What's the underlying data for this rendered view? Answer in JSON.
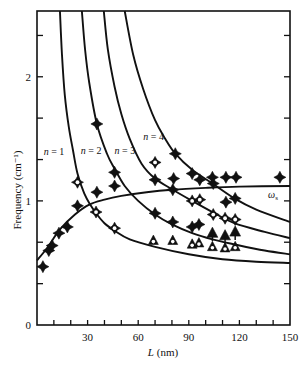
{
  "chart_data": {
    "type": "scatter",
    "title": "",
    "xlabel": "L (nm)",
    "xlabel_var": "L",
    "xlabel_unit": "(nm)",
    "ylabel": "Frequency (cm⁻¹)",
    "xlim": [
      0,
      150
    ],
    "ylim": [
      0,
      2.53
    ],
    "x_ticks": [
      0,
      10,
      20,
      30,
      40,
      50,
      60,
      70,
      80,
      90,
      100,
      110,
      120,
      130,
      140,
      150
    ],
    "x_tick_labels": [
      {
        "value": 30,
        "label": "30"
      },
      {
        "value": 60,
        "label": "60"
      },
      {
        "value": 90,
        "label": "90"
      },
      {
        "value": 120,
        "label": "120"
      },
      {
        "value": 150,
        "label": "150"
      }
    ],
    "y_ticks": [
      0,
      0.333,
      0.667,
      1,
      1.333,
      1.667,
      2,
      2.333
    ],
    "y_tick_labels": [
      {
        "value": 0,
        "label": "0"
      },
      {
        "value": 1,
        "label": "1"
      },
      {
        "value": 2,
        "label": "2"
      }
    ],
    "grid": false,
    "curves": [
      {
        "name": "n = 1",
        "label": "n = 1",
        "label_pos": [
          4,
          1.37
        ],
        "points": [
          [
            13.6,
            2.53
          ],
          [
            14.8,
            2.18
          ],
          [
            16.5,
            1.85
          ],
          [
            18.8,
            1.6
          ],
          [
            21.3,
            1.41
          ],
          [
            24,
            1.22
          ],
          [
            28,
            1.06
          ],
          [
            32,
            0.96
          ],
          [
            35,
            0.9
          ],
          [
            40,
            0.82
          ],
          [
            46,
            0.76
          ],
          [
            55,
            0.69
          ],
          [
            70,
            0.63
          ],
          [
            90,
            0.57
          ],
          [
            110,
            0.53
          ],
          [
            130,
            0.51
          ],
          [
            150,
            0.5
          ]
        ]
      },
      {
        "name": "n = 2",
        "label": "n = 2",
        "label_pos": [
          26,
          1.38
        ],
        "points": [
          [
            26.6,
            2.53
          ],
          [
            28.5,
            2.22
          ],
          [
            31,
            1.95
          ],
          [
            35.5,
            1.62
          ],
          [
            41.5,
            1.38
          ],
          [
            46,
            1.26
          ],
          [
            52,
            1.12
          ],
          [
            60,
            1.0
          ],
          [
            70,
            0.89
          ],
          [
            80,
            0.81
          ],
          [
            92,
            0.74
          ],
          [
            104,
            0.69
          ],
          [
            117,
            0.65
          ],
          [
            135,
            0.6
          ],
          [
            150,
            0.57
          ]
        ]
      },
      {
        "name": "n = 3",
        "label": "n = 3",
        "label_pos": [
          46,
          1.38
        ],
        "points": [
          [
            39.6,
            2.53
          ],
          [
            42,
            2.22
          ],
          [
            46,
            1.92
          ],
          [
            50,
            1.7
          ],
          [
            55,
            1.5
          ],
          [
            62,
            1.3
          ],
          [
            70,
            1.18
          ],
          [
            80.5,
            1.09
          ],
          [
            92,
            1.0
          ],
          [
            104,
            0.91
          ],
          [
            117,
            0.82
          ],
          [
            135,
            0.75
          ],
          [
            150,
            0.7
          ]
        ]
      },
      {
        "name": "n = 4",
        "label": "n = 4",
        "label_pos": [
          63,
          1.49
        ],
        "points": [
          [
            52,
            2.53
          ],
          [
            57,
            2.18
          ],
          [
            63,
            1.9
          ],
          [
            70,
            1.65
          ],
          [
            76,
            1.5
          ],
          [
            82,
            1.38
          ],
          [
            92,
            1.25
          ],
          [
            104,
            1.14
          ],
          [
            117,
            1.02
          ],
          [
            130,
            0.93
          ],
          [
            150,
            0.83
          ]
        ]
      },
      {
        "name": "ωs",
        "label": "ω",
        "label_sub": "s",
        "label_pos": [
          137,
          1.02
        ],
        "points": [
          [
            0,
            0.52
          ],
          [
            6,
            0.62
          ],
          [
            13.6,
            0.77
          ],
          [
            22.5,
            0.89
          ],
          [
            31,
            0.97
          ],
          [
            40,
            1.01
          ],
          [
            50,
            1.04
          ],
          [
            65,
            1.07
          ],
          [
            80,
            1.09
          ],
          [
            100,
            1.105
          ],
          [
            120,
            1.115
          ],
          [
            150,
            1.12
          ]
        ]
      }
    ],
    "series": [
      {
        "name": "filled-diamond",
        "marker": "filled-star",
        "points": [
          [
            3.5,
            0.47
          ],
          [
            7,
            0.6
          ],
          [
            9,
            0.64
          ],
          [
            13,
            0.74
          ],
          [
            18,
            0.79
          ],
          [
            24,
            0.96
          ],
          [
            35.5,
            1.07
          ],
          [
            35.5,
            1.62
          ],
          [
            46,
            1.23
          ],
          [
            46,
            1.12
          ],
          [
            70,
            1.17
          ],
          [
            81,
            1.18
          ],
          [
            80.5,
            1.09
          ],
          [
            82,
            1.38
          ],
          [
            92,
            1.22
          ],
          [
            96.5,
            1.17
          ],
          [
            104,
            1.19
          ],
          [
            104.5,
            1.14
          ],
          [
            112,
            1.19
          ],
          [
            118,
            1.19
          ],
          [
            144,
            1.19
          ],
          [
            112,
            0.99
          ],
          [
            117.5,
            1.02
          ],
          [
            70,
            0.9
          ],
          [
            80.5,
            0.83
          ],
          [
            92,
            0.79
          ],
          [
            96,
            0.81
          ]
        ]
      },
      {
        "name": "open-star",
        "marker": "open-star",
        "points": [
          [
            24,
            1.15
          ],
          [
            35,
            0.91
          ],
          [
            46,
            0.78
          ],
          [
            70,
            1.31
          ],
          [
            92,
            1.0
          ],
          [
            96.5,
            1.01
          ],
          [
            104.5,
            0.89
          ],
          [
            111.5,
            0.86
          ],
          [
            117.5,
            0.85
          ]
        ]
      },
      {
        "name": "filled-triangle",
        "marker": "filled-triangle",
        "points": [
          [
            104,
            0.74
          ],
          [
            111.5,
            0.72
          ],
          [
            117.5,
            0.75
          ]
        ]
      },
      {
        "name": "open-triangle",
        "marker": "open-triangle",
        "points": [
          [
            69,
            0.68
          ],
          [
            80.5,
            0.68
          ],
          [
            92,
            0.65
          ],
          [
            96,
            0.66
          ],
          [
            104,
            0.63
          ],
          [
            111.5,
            0.62
          ],
          [
            117.5,
            0.63
          ]
        ]
      }
    ]
  },
  "labels": {
    "ylabel": "Frequency (cm⁻¹)",
    "xlabel_var": "L",
    "xlabel_unit": " (nm)"
  }
}
